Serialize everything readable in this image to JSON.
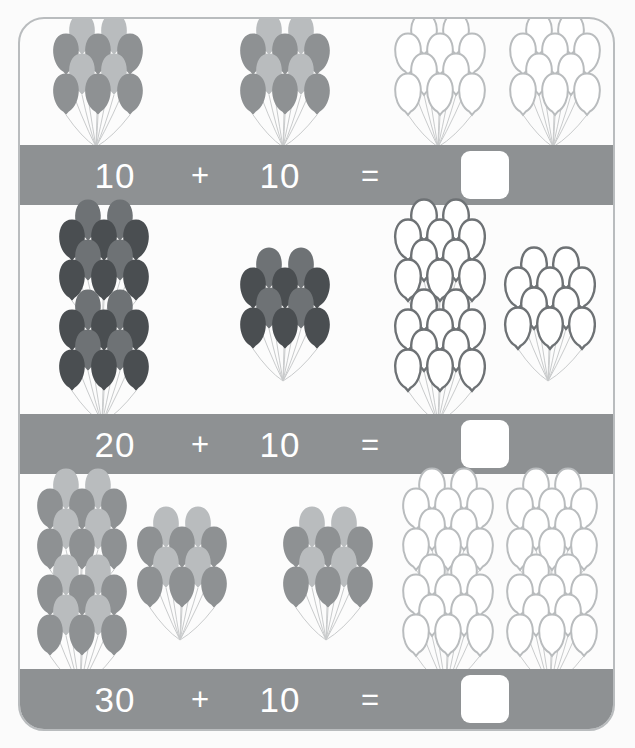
{
  "worksheet": {
    "title": "Balloon addition worksheet",
    "frame_border_color": "#b9bcbe",
    "bar_color": "#8e9193",
    "answer_box_color": "#ffffff",
    "background_color": "#fcfcfc"
  },
  "balloon_colors": {
    "light": "#b9bcbe",
    "mid": "#8e9193",
    "dark_mid": "#6e7275",
    "dark": "#4a4e51",
    "outline_light": "#b9bcbe",
    "outline_dark": "#6e7275",
    "string": "#c9cbcc"
  },
  "problems": [
    {
      "id": "problem-1",
      "addend1": "10",
      "addend2": "10",
      "plus": "+",
      "equals": "=",
      "answer": "",
      "addend1_clusters": 1,
      "addend2_clusters": 1,
      "sum_clusters": 2,
      "balloons_per_cluster": 10,
      "addend1_total": 10,
      "addend2_total": 10,
      "sum_total": 20,
      "fill_tone": "light",
      "outline_tone": "outline_light"
    },
    {
      "id": "problem-2",
      "addend1": "20",
      "addend2": "10",
      "plus": "+",
      "equals": "=",
      "answer": "",
      "addend1_clusters": 2,
      "addend2_clusters": 1,
      "sum_clusters": 3,
      "balloons_per_cluster": 10,
      "addend1_total": 20,
      "addend2_total": 10,
      "sum_total": 30,
      "fill_tone": "dark",
      "outline_tone": "outline_dark"
    },
    {
      "id": "problem-3",
      "addend1": "30",
      "addend2": "10",
      "plus": "+",
      "equals": "=",
      "answer": "",
      "addend1_clusters": 3,
      "addend2_clusters": 1,
      "sum_clusters": 4,
      "balloons_per_cluster": 10,
      "addend1_total": 30,
      "addend2_total": 10,
      "sum_total": 40,
      "fill_tone": "light",
      "outline_tone": "outline_light"
    }
  ]
}
